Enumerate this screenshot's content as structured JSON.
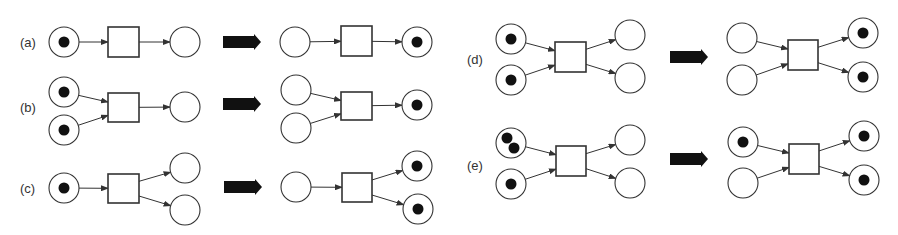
{
  "figure": {
    "colors": {
      "stroke": "#333333",
      "token": "#111111",
      "background": "#ffffff",
      "firing_arrow": "#111111"
    }
  },
  "panels": [
    {
      "id": "a",
      "label": "(a)",
      "label_pos": [
        20,
        47
      ],
      "before": {
        "places": [
          {
            "cx": 64,
            "cy": 42,
            "tokens": 1
          },
          {
            "cx": 185,
            "cy": 42,
            "tokens": 0
          }
        ],
        "transition": {
          "x": 108,
          "y": 27,
          "w": 31,
          "h": 30
        },
        "arcs": [
          {
            "from": "p0",
            "to": "t"
          },
          {
            "from": "t",
            "to": "p1"
          }
        ]
      },
      "arrow": {
        "x": 223,
        "y": 42
      },
      "after": {
        "places": [
          {
            "cx": 295,
            "cy": 42,
            "tokens": 0
          },
          {
            "cx": 417,
            "cy": 42,
            "tokens": 1
          }
        ],
        "transition": {
          "x": 341,
          "y": 26,
          "w": 31,
          "h": 30
        },
        "arcs": [
          {
            "from": "p0",
            "to": "t"
          },
          {
            "from": "t",
            "to": "p1"
          }
        ]
      }
    },
    {
      "id": "b",
      "label": "(b)",
      "label_pos": [
        20,
        112
      ],
      "before": {
        "places": [
          {
            "cx": 64,
            "cy": 92,
            "tokens": 1
          },
          {
            "cx": 64,
            "cy": 130,
            "tokens": 1
          },
          {
            "cx": 185,
            "cy": 107,
            "tokens": 0
          }
        ],
        "transition": {
          "x": 108,
          "y": 93,
          "w": 31,
          "h": 29
        },
        "arcs": [
          {
            "from": "p0",
            "to": "t"
          },
          {
            "from": "p1",
            "to": "t"
          },
          {
            "from": "t",
            "to": "p2"
          }
        ]
      },
      "arrow": {
        "x": 223,
        "y": 104
      },
      "after": {
        "places": [
          {
            "cx": 296,
            "cy": 90,
            "tokens": 0
          },
          {
            "cx": 296,
            "cy": 128,
            "tokens": 0
          },
          {
            "cx": 417,
            "cy": 105,
            "tokens": 1
          }
        ],
        "transition": {
          "x": 341,
          "y": 92,
          "w": 31,
          "h": 28
        },
        "arcs": [
          {
            "from": "p0",
            "to": "t"
          },
          {
            "from": "p1",
            "to": "t"
          },
          {
            "from": "t",
            "to": "p2"
          }
        ]
      }
    },
    {
      "id": "c",
      "label": "(c)",
      "label_pos": [
        20,
        193
      ],
      "before": {
        "places": [
          {
            "cx": 64,
            "cy": 188,
            "tokens": 1
          },
          {
            "cx": 185,
            "cy": 168,
            "tokens": 0
          },
          {
            "cx": 185,
            "cy": 210,
            "tokens": 0
          }
        ],
        "transition": {
          "x": 108,
          "y": 174,
          "w": 31,
          "h": 29
        },
        "arcs": [
          {
            "from": "p0",
            "to": "t"
          },
          {
            "from": "t",
            "to": "p1"
          },
          {
            "from": "t",
            "to": "p2"
          }
        ]
      },
      "arrow": {
        "x": 224,
        "y": 187
      },
      "after": {
        "places": [
          {
            "cx": 296,
            "cy": 187,
            "tokens": 0
          },
          {
            "cx": 417,
            "cy": 166,
            "tokens": 1
          },
          {
            "cx": 418,
            "cy": 209,
            "tokens": 1
          }
        ],
        "transition": {
          "x": 342,
          "y": 173,
          "w": 30,
          "h": 29
        },
        "arcs": [
          {
            "from": "p0",
            "to": "t"
          },
          {
            "from": "t",
            "to": "p1"
          },
          {
            "from": "t",
            "to": "p2"
          }
        ]
      }
    },
    {
      "id": "d",
      "label": "(d)",
      "label_pos": [
        467,
        64
      ],
      "before": {
        "places": [
          {
            "cx": 511,
            "cy": 39,
            "tokens": 1
          },
          {
            "cx": 511,
            "cy": 80,
            "tokens": 1
          },
          {
            "cx": 630,
            "cy": 35,
            "tokens": 0
          },
          {
            "cx": 630,
            "cy": 78,
            "tokens": 0
          }
        ],
        "transition": {
          "x": 555,
          "y": 42,
          "w": 31,
          "h": 30
        },
        "arcs": [
          {
            "from": "p0",
            "to": "t"
          },
          {
            "from": "p1",
            "to": "t"
          },
          {
            "from": "t",
            "to": "p2"
          },
          {
            "from": "t",
            "to": "p3"
          }
        ]
      },
      "arrow": {
        "x": 670,
        "y": 57
      },
      "after": {
        "places": [
          {
            "cx": 742,
            "cy": 38,
            "tokens": 0
          },
          {
            "cx": 742,
            "cy": 80,
            "tokens": 0
          },
          {
            "cx": 863,
            "cy": 33,
            "tokens": 1
          },
          {
            "cx": 863,
            "cy": 77,
            "tokens": 1
          }
        ],
        "transition": {
          "x": 788,
          "y": 40,
          "w": 30,
          "h": 30
        },
        "arcs": [
          {
            "from": "p0",
            "to": "t"
          },
          {
            "from": "p1",
            "to": "t"
          },
          {
            "from": "t",
            "to": "p2"
          },
          {
            "from": "t",
            "to": "p3"
          }
        ]
      }
    },
    {
      "id": "e",
      "label": "(e)",
      "label_pos": [
        467,
        170
      ],
      "before": {
        "places": [
          {
            "cx": 511,
            "cy": 143,
            "tokens": 2
          },
          {
            "cx": 511,
            "cy": 184,
            "tokens": 1
          },
          {
            "cx": 630,
            "cy": 140,
            "tokens": 0
          },
          {
            "cx": 630,
            "cy": 183,
            "tokens": 0
          }
        ],
        "transition": {
          "x": 556,
          "y": 146,
          "w": 30,
          "h": 30
        },
        "arcs": [
          {
            "from": "p0",
            "to": "t"
          },
          {
            "from": "p1",
            "to": "t"
          },
          {
            "from": "t",
            "to": "p2"
          },
          {
            "from": "t",
            "to": "p3"
          }
        ]
      },
      "arrow": {
        "x": 670,
        "y": 159
      },
      "after": {
        "places": [
          {
            "cx": 743,
            "cy": 142,
            "tokens": 1
          },
          {
            "cx": 743,
            "cy": 183,
            "tokens": 0
          },
          {
            "cx": 864,
            "cy": 136,
            "tokens": 1
          },
          {
            "cx": 864,
            "cy": 180,
            "tokens": 1
          }
        ],
        "transition": {
          "x": 789,
          "y": 144,
          "w": 30,
          "h": 30
        },
        "arcs": [
          {
            "from": "p0",
            "to": "t"
          },
          {
            "from": "p1",
            "to": "t"
          },
          {
            "from": "t",
            "to": "p2"
          },
          {
            "from": "t",
            "to": "p3"
          }
        ]
      }
    }
  ]
}
